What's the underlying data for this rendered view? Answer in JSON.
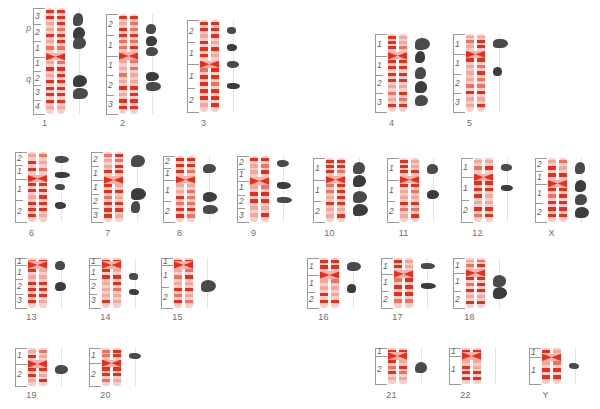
{
  "figure": {
    "type": "karyotype-ideogram",
    "title": "",
    "rows": 4,
    "colors": {
      "chromatid_body": "#f7cfca",
      "band_dark": "#ef2b18",
      "band_light": "#f6a79c",
      "blob": "#4a4a4a",
      "ruler_line": "#9a9a9a",
      "label_text": "#6e6e6e",
      "background": "#ffffff"
    },
    "arm_letters": {
      "p": "p",
      "q": "q"
    }
  },
  "chromosomes": [
    {
      "name": "1",
      "row": 1,
      "x": 22,
      "y": 8,
      "w": 56,
      "h": 106,
      "label_y": 118,
      "p_regions": [
        "3",
        "2",
        "1"
      ],
      "q_regions": [
        "1",
        "2",
        "3",
        "4"
      ],
      "arm_letters": true,
      "cent": 0.46,
      "blobs": [
        0.05,
        0.18,
        0.27,
        0.63,
        0.75
      ]
    },
    {
      "name": "2",
      "row": 1,
      "x": 105,
      "y": 14,
      "w": 56,
      "h": 100,
      "label_y": 118,
      "p_regions": [
        "2",
        "1"
      ],
      "q_regions": [
        "1",
        "2",
        "3"
      ],
      "arm_letters": false,
      "cent": 0.42,
      "blobs": [
        0.1,
        0.22,
        0.33,
        0.58,
        0.68
      ]
    },
    {
      "name": "3",
      "row": 1,
      "x": 186,
      "y": 20,
      "w": 56,
      "h": 92,
      "label_y": 118,
      "p_regions": [
        "2",
        "1"
      ],
      "q_regions": [
        "1",
        "2"
      ],
      "arm_letters": false,
      "cent": 0.48,
      "blobs": [
        0.08,
        0.26,
        0.45,
        0.68
      ]
    },
    {
      "name": "4",
      "row": 1,
      "x": 374,
      "y": 34,
      "w": 56,
      "h": 78,
      "label_y": 118,
      "p_regions": [
        "1"
      ],
      "q_regions": [
        "1",
        "2",
        "3"
      ],
      "arm_letters": false,
      "cent": 0.28,
      "blobs": [
        0.05,
        0.22,
        0.42,
        0.6,
        0.78
      ]
    },
    {
      "name": "5",
      "row": 1,
      "x": 452,
      "y": 34,
      "w": 56,
      "h": 78,
      "label_y": 118,
      "p_regions": [
        "1"
      ],
      "q_regions": [
        "1",
        "2",
        "3"
      ],
      "arm_letters": false,
      "cent": 0.26,
      "blobs": [
        0.06,
        0.42
      ]
    },
    {
      "name": "6",
      "row": 2,
      "x": 14,
      "y": 152,
      "w": 56,
      "h": 70,
      "label_y": 228,
      "p_regions": [
        "2",
        "1"
      ],
      "q_regions": [
        "1",
        "2"
      ],
      "arm_letters": false,
      "cent": 0.38,
      "blobs": [
        0.06,
        0.28,
        0.45,
        0.72
      ]
    },
    {
      "name": "7",
      "row": 2,
      "x": 90,
      "y": 152,
      "w": 56,
      "h": 70,
      "label_y": 228,
      "p_regions": [
        "2",
        "1"
      ],
      "q_regions": [
        "1",
        "2",
        "3"
      ],
      "arm_letters": false,
      "cent": 0.4,
      "blobs": [
        0.04,
        0.52,
        0.7
      ]
    },
    {
      "name": "8",
      "row": 2,
      "x": 162,
      "y": 156,
      "w": 56,
      "h": 66,
      "label_y": 228,
      "p_regions": [
        "2",
        "1"
      ],
      "q_regions": [
        "1",
        "2"
      ],
      "arm_letters": false,
      "cent": 0.36,
      "blobs": [
        0.12,
        0.55,
        0.74
      ]
    },
    {
      "name": "9",
      "row": 2,
      "x": 236,
      "y": 156,
      "w": 56,
      "h": 66,
      "label_y": 228,
      "p_regions": [
        "2",
        "1"
      ],
      "q_regions": [
        "1",
        "2",
        "3"
      ],
      "arm_letters": false,
      "cent": 0.38,
      "blobs": [
        0.06,
        0.4,
        0.62
      ]
    },
    {
      "name": "10",
      "row": 2,
      "x": 312,
      "y": 158,
      "w": 56,
      "h": 64,
      "label_y": 228,
      "p_regions": [
        "1"
      ],
      "q_regions": [
        "1",
        "2"
      ],
      "arm_letters": false,
      "cent": 0.34,
      "blobs": [
        0.06,
        0.26,
        0.52,
        0.72
      ]
    },
    {
      "name": "11",
      "row": 2,
      "x": 386,
      "y": 158,
      "w": 56,
      "h": 64,
      "label_y": 228,
      "p_regions": [
        "1"
      ],
      "q_regions": [
        "1",
        "2"
      ],
      "arm_letters": false,
      "cent": 0.34,
      "blobs": [
        0.1,
        0.5
      ]
    },
    {
      "name": "12",
      "row": 2,
      "x": 460,
      "y": 158,
      "w": 56,
      "h": 64,
      "label_y": 228,
      "p_regions": [
        "1"
      ],
      "q_regions": [
        "1",
        "2"
      ],
      "arm_letters": false,
      "cent": 0.3,
      "blobs": [
        0.1,
        0.42
      ]
    },
    {
      "name": "X",
      "row": 2,
      "x": 534,
      "y": 158,
      "w": 56,
      "h": 64,
      "label_y": 228,
      "p_regions": [
        "2",
        "1"
      ],
      "q_regions": [
        "1",
        "2"
      ],
      "arm_letters": false,
      "cent": 0.4,
      "blobs": [
        0.06,
        0.34,
        0.56,
        0.76
      ]
    },
    {
      "name": "13",
      "row": 3,
      "x": 14,
      "y": 258,
      "w": 56,
      "h": 50,
      "label_y": 312,
      "p_regions": [
        "1"
      ],
      "q_regions": [
        "1",
        "2",
        "3"
      ],
      "arm_letters": false,
      "cent": 0.14,
      "blobs": [
        0.06,
        0.48
      ]
    },
    {
      "name": "14",
      "row": 3,
      "x": 88,
      "y": 258,
      "w": 56,
      "h": 50,
      "label_y": 312,
      "p_regions": [
        "1"
      ],
      "q_regions": [
        "1",
        "2",
        "3"
      ],
      "arm_letters": false,
      "cent": 0.14,
      "blobs": [
        0.3,
        0.62
      ]
    },
    {
      "name": "15",
      "row": 3,
      "x": 160,
      "y": 258,
      "w": 56,
      "h": 50,
      "label_y": 312,
      "p_regions": [
        "1"
      ],
      "q_regions": [
        "1",
        "2"
      ],
      "arm_letters": false,
      "cent": 0.14,
      "blobs": [
        0.44
      ]
    },
    {
      "name": "16",
      "row": 3,
      "x": 306,
      "y": 258,
      "w": 56,
      "h": 50,
      "label_y": 312,
      "p_regions": [
        "1"
      ],
      "q_regions": [
        "1",
        "2"
      ],
      "arm_letters": false,
      "cent": 0.34,
      "blobs": [
        0.08,
        0.52
      ]
    },
    {
      "name": "17",
      "row": 3,
      "x": 380,
      "y": 258,
      "w": 56,
      "h": 50,
      "label_y": 312,
      "p_regions": [
        "1"
      ],
      "q_regions": [
        "1",
        "2"
      ],
      "arm_letters": false,
      "cent": 0.32,
      "blobs": [
        0.1,
        0.5
      ]
    },
    {
      "name": "18",
      "row": 3,
      "x": 452,
      "y": 258,
      "w": 56,
      "h": 50,
      "label_y": 312,
      "p_regions": [
        "1"
      ],
      "q_regions": [
        "1",
        "2"
      ],
      "arm_letters": false,
      "cent": 0.3,
      "blobs": [
        0.34,
        0.58
      ]
    },
    {
      "name": "19",
      "row": 4,
      "x": 14,
      "y": 348,
      "w": 56,
      "h": 38,
      "label_y": 390,
      "p_regions": [
        "1"
      ],
      "q_regions": [
        "2"
      ],
      "arm_letters": false,
      "cent": 0.42,
      "blobs": [
        0.46
      ]
    },
    {
      "name": "20",
      "row": 4,
      "x": 88,
      "y": 348,
      "w": 56,
      "h": 38,
      "label_y": 390,
      "p_regions": [
        "1"
      ],
      "q_regions": [
        "2"
      ],
      "arm_letters": false,
      "cent": 0.4,
      "blobs": [
        0.12
      ]
    },
    {
      "name": "21",
      "row": 4,
      "x": 374,
      "y": 348,
      "w": 56,
      "h": 36,
      "label_y": 390,
      "p_regions": [
        "1"
      ],
      "q_regions": [
        "2"
      ],
      "arm_letters": false,
      "cent": 0.22,
      "blobs": [
        0.38
      ]
    },
    {
      "name": "22",
      "row": 4,
      "x": 448,
      "y": 348,
      "w": 56,
      "h": 36,
      "label_y": 390,
      "p_regions": [
        "1"
      ],
      "q_regions": [
        "1"
      ],
      "arm_letters": false,
      "cent": 0.22,
      "blobs": []
    },
    {
      "name": "Y",
      "row": 4,
      "x": 528,
      "y": 348,
      "w": 56,
      "h": 36,
      "label_y": 390,
      "p_regions": [
        "1"
      ],
      "q_regions": [
        "1"
      ],
      "arm_letters": false,
      "cent": 0.26,
      "blobs": [
        0.42
      ]
    }
  ]
}
